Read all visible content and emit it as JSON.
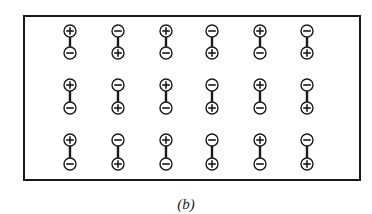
{
  "figure": {
    "caption": "(b)",
    "box": {
      "x": 24,
      "y": 16,
      "width": 336,
      "height": 164
    },
    "colors": {
      "stroke": "#1a1a1a",
      "background": "#ffffff"
    },
    "dipole": {
      "radius": 6,
      "rod_width": 2.4
    },
    "columns_x": [
      70,
      118,
      166,
      212,
      260,
      307
    ],
    "rows": [
      {
        "top_y": 31,
        "bottom_y": 53,
        "orientations": [
          "+-",
          "-+",
          "+-",
          "-+",
          "+-",
          "-+"
        ]
      },
      {
        "top_y": 85,
        "bottom_y": 108,
        "orientations": [
          "+-",
          "-+",
          "+-",
          "-+",
          "+-",
          "-+"
        ]
      },
      {
        "top_y": 140,
        "bottom_y": 164,
        "orientations": [
          "+-",
          "-+",
          "+-",
          "-+",
          "+-",
          "-+"
        ]
      }
    ]
  }
}
